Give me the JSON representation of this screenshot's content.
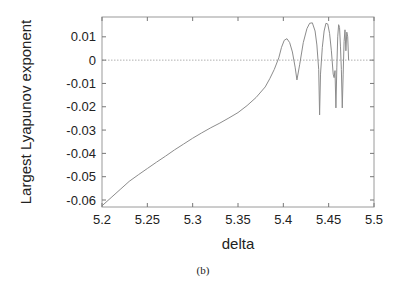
{
  "chart_data": {
    "type": "line",
    "title": "",
    "xlabel": "delta",
    "ylabel": "Largest Lyapunov exponent",
    "caption": "(b)",
    "xlim": [
      5.2,
      5.5
    ],
    "ylim": [
      -0.063,
      0.0185
    ],
    "xticks": [
      5.2,
      5.25,
      5.3,
      5.35,
      5.4,
      5.45,
      5.5
    ],
    "xtick_labels": [
      "5.2",
      "5.25",
      "5.3",
      "5.35",
      "5.4",
      "5.45",
      "5.5"
    ],
    "yticks": [
      0.01,
      0,
      -0.01,
      -0.02,
      -0.03,
      -0.04,
      -0.05,
      -0.06
    ],
    "ytick_labels": [
      "0.01",
      "0",
      "-0.01",
      "-0.02",
      "-0.03",
      "-0.04",
      "-0.05",
      "-0.06"
    ],
    "grid": false,
    "reference_line": {
      "y": 0,
      "style": "dotted"
    },
    "series": [
      {
        "name": "Largest Lyapunov exponent",
        "color": "#8c8c8c",
        "x": [
          5.2,
          5.21,
          5.22,
          5.23,
          5.24,
          5.25,
          5.26,
          5.27,
          5.28,
          5.29,
          5.3,
          5.31,
          5.32,
          5.33,
          5.34,
          5.35,
          5.36,
          5.37,
          5.38,
          5.385,
          5.39,
          5.395,
          5.398,
          5.401,
          5.404,
          5.407,
          5.41,
          5.413,
          5.415,
          5.418,
          5.422,
          5.426,
          5.429,
          5.432,
          5.435,
          5.437,
          5.439,
          5.44,
          5.441,
          5.443,
          5.445,
          5.447,
          5.449,
          5.451,
          5.453,
          5.455,
          5.456,
          5.457,
          5.458,
          5.459,
          5.46,
          5.461,
          5.462,
          5.463,
          5.464,
          5.465,
          5.466,
          5.467,
          5.468,
          5.469,
          5.47,
          5.471,
          5.472
        ],
        "y": [
          -0.0625,
          -0.059,
          -0.0555,
          -0.052,
          -0.0492,
          -0.0465,
          -0.0438,
          -0.0412,
          -0.0385,
          -0.036,
          -0.0335,
          -0.0312,
          -0.029,
          -0.027,
          -0.0248,
          -0.0225,
          -0.0195,
          -0.016,
          -0.0115,
          -0.008,
          -0.004,
          0.001,
          0.0055,
          0.0085,
          0.0092,
          0.0075,
          0.0035,
          -0.003,
          -0.0085,
          -0.002,
          0.0075,
          0.0135,
          0.0158,
          0.016,
          0.0125,
          0.0065,
          -0.004,
          -0.0235,
          -0.006,
          0.0055,
          0.0125,
          0.0158,
          0.0155,
          0.0115,
          0.004,
          -0.006,
          -0.0075,
          -0.0045,
          -0.0205,
          -0.003,
          0.01,
          0.0152,
          0.014,
          0.006,
          -0.004,
          -0.0205,
          -0.006,
          0.008,
          0.013,
          0.004,
          0.012,
          0.01,
          0.0
        ]
      }
    ]
  }
}
